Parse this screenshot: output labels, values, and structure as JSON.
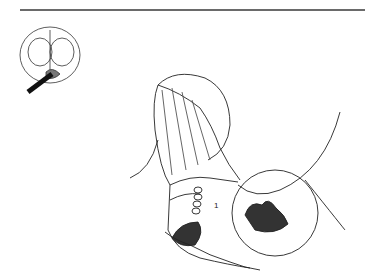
{
  "figure": {
    "label_marker": "1",
    "colors": {
      "ink": "#1a1a1a",
      "rule": "#6a6a6a",
      "background": "#ffffff"
    },
    "inset": {
      "description": "cross-section orientation thumbnail with arrow"
    },
    "main": {
      "description": "surgical anatomical line illustration with magnifier circles"
    }
  }
}
